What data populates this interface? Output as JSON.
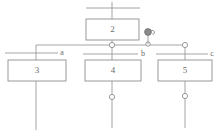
{
  "diagram": {
    "type": "single-line-bus-diagram",
    "canvas": {
      "width": 220,
      "height": 134,
      "background": "#ffffff"
    },
    "style": {
      "line_color": "#9a9a9a",
      "box_stroke": "#8f8f8f",
      "box_fill": "#ffffff",
      "text_color": "#6b6b6b",
      "node_stroke": "#8f8f8f",
      "node_fill": "#ffffff"
    },
    "boxes": [
      {
        "id": "box-2",
        "label": "2",
        "x": 86,
        "y": 19,
        "width": 53,
        "height": 21
      },
      {
        "id": "box-3",
        "label": "3",
        "x": 8,
        "y": 60,
        "width": 58,
        "height": 21
      },
      {
        "id": "box-4",
        "label": "4",
        "x": 85,
        "y": 60,
        "width": 56,
        "height": 21
      },
      {
        "id": "box-5",
        "label": "5",
        "x": 158,
        "y": 60,
        "width": 54,
        "height": 21
      }
    ],
    "branch_labels": [
      {
        "id": "label-a",
        "text": "a",
        "x": 62,
        "y": 53
      },
      {
        "id": "label-b",
        "text": "b",
        "x": 143,
        "y": 54
      },
      {
        "id": "label-c",
        "text": "c",
        "x": 212,
        "y": 54
      }
    ],
    "junction_nodes": [
      {
        "id": "node-bus-center",
        "x": 112,
        "y": 45,
        "r": 2.6
      },
      {
        "id": "node-bus-right",
        "x": 185,
        "y": 45,
        "r": 2.6
      },
      {
        "id": "node-annotation",
        "x": 148,
        "y": 44,
        "r": 2.2
      },
      {
        "id": "node-box4-out",
        "x": 112,
        "y": 97,
        "r": 2.6
      },
      {
        "id": "node-box5-out",
        "x": 185,
        "y": 96,
        "r": 2.6
      }
    ],
    "annotation_marker": {
      "id": "marker-swirl",
      "x": 148,
      "y": 32,
      "r": 3.4,
      "stem_bottom_y": 44
    },
    "bus_lines": [
      {
        "id": "top-feeder-bar",
        "x1": 86,
        "y1": 8,
        "x2": 140,
        "y2": 8
      },
      {
        "id": "main-bus",
        "x1": 36,
        "y1": 45,
        "x2": 185,
        "y2": 45
      },
      {
        "id": "tap-bar-a",
        "x1": 5,
        "y1": 53,
        "x2": 58,
        "y2": 53
      },
      {
        "id": "tap-bar-b",
        "x1": 83,
        "y1": 54,
        "x2": 138,
        "y2": 54
      },
      {
        "id": "tap-bar-c",
        "x1": 156,
        "y1": 54,
        "x2": 208,
        "y2": 54
      }
    ],
    "stems": [
      {
        "id": "stem-top-in",
        "x1": 112,
        "y1": 2,
        "x2": 112,
        "y2": 19
      },
      {
        "id": "stem-box2-out",
        "x1": 112,
        "y1": 40,
        "x2": 112,
        "y2": 60
      },
      {
        "id": "stem-bus-left",
        "x1": 36,
        "y1": 45,
        "x2": 36,
        "y2": 60
      },
      {
        "id": "stem-bus-right",
        "x1": 185,
        "y1": 45,
        "x2": 185,
        "y2": 60
      },
      {
        "id": "stem-box3-out",
        "x1": 36,
        "y1": 81,
        "x2": 36,
        "y2": 130
      },
      {
        "id": "stem-box4-out",
        "x1": 112,
        "y1": 81,
        "x2": 112,
        "y2": 128
      },
      {
        "id": "stem-box5-out",
        "x1": 185,
        "y1": 81,
        "x2": 185,
        "y2": 128
      }
    ]
  }
}
